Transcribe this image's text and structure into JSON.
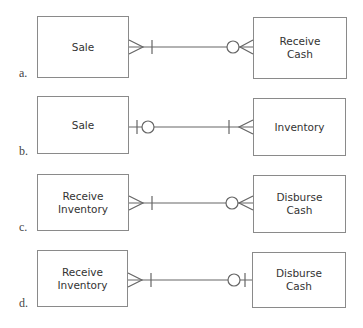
{
  "header_cutoff_text": "...the relationship between the economic events...",
  "diagrams": [
    {
      "label": "a.",
      "left_entity": "Sale",
      "right_entity": "Receive\nCash",
      "left_end": [
        "crows-foot",
        "bar"
      ],
      "right_end": [
        "circle",
        "crows-foot"
      ]
    },
    {
      "label": "b.",
      "left_entity": "Sale",
      "right_entity": "Inventory",
      "left_end": [
        "bar",
        "circle"
      ],
      "right_end": [
        "bar",
        "crows-foot"
      ]
    },
    {
      "label": "c.",
      "left_entity": "Receive\nInventory",
      "right_entity": "Disburse\nCash",
      "left_end": [
        "crows-foot",
        "bar"
      ],
      "right_end": [
        "circle",
        "crows-foot"
      ]
    },
    {
      "label": "d.",
      "left_entity": "Receive\nInventory",
      "right_entity": "Disburse\nCash",
      "left_end": [
        "crows-foot",
        "bar"
      ],
      "right_end": [
        "circle",
        "bar"
      ]
    }
  ],
  "colors": {
    "line": "#666666",
    "box_border": "#8a8a8a",
    "text": "#333333"
  }
}
